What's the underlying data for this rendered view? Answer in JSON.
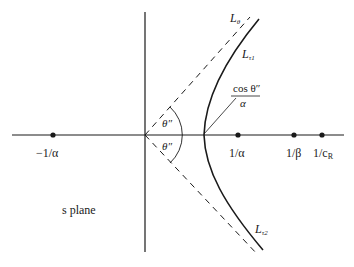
{
  "diagram": {
    "plane_label": "s plane",
    "axis_points": [
      {
        "label": "−1/α",
        "x": 53
      },
      {
        "label": "1/α",
        "x": 238
      },
      {
        "label": "1/β",
        "x": 294
      },
      {
        "label": "1/c",
        "sub": "R",
        "x": 322
      }
    ],
    "curves": {
      "asymptote_label": "L",
      "asymptote_sub": "θ",
      "upper_branch_label": "L",
      "upper_branch_sub": "τ1",
      "lower_branch_label": "L",
      "lower_branch_sub": "τ2"
    },
    "angles": {
      "upper": "θ″",
      "lower": "θ″"
    },
    "vertex_annotation": {
      "numerator": "cos θ″",
      "denominator": "α"
    },
    "colors": {
      "line": "#1a1a1a",
      "background": "#ffffff"
    }
  }
}
